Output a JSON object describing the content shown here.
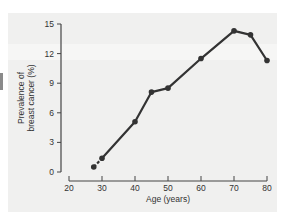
{
  "chart_data": {
    "type": "line",
    "title": "",
    "xlabel": "Age (years)",
    "ylabel_lines": [
      "Prevalence of",
      "breast cancer (%)"
    ],
    "ylabel": "Prevalence of breast cancer (%)",
    "x_ticks": [
      20,
      30,
      40,
      50,
      60,
      70,
      80
    ],
    "y_ticks": [
      0,
      3,
      6,
      9,
      12,
      15
    ],
    "xlim": [
      20,
      80
    ],
    "ylim": [
      0,
      15
    ],
    "grid": false,
    "legend": null,
    "series": [
      {
        "name": "Prevalence of breast cancer",
        "color": "#333333",
        "x": [
          27.5,
          30,
          40,
          45,
          50,
          60,
          70,
          75,
          80
        ],
        "y": [
          0.5,
          1.4,
          5.1,
          8.1,
          8.5,
          11.5,
          14.3,
          13.9,
          11.3
        ]
      }
    ]
  },
  "colors": {
    "panel_background": "#f0f0ef",
    "line": "#333333",
    "axis": "#444444"
  }
}
